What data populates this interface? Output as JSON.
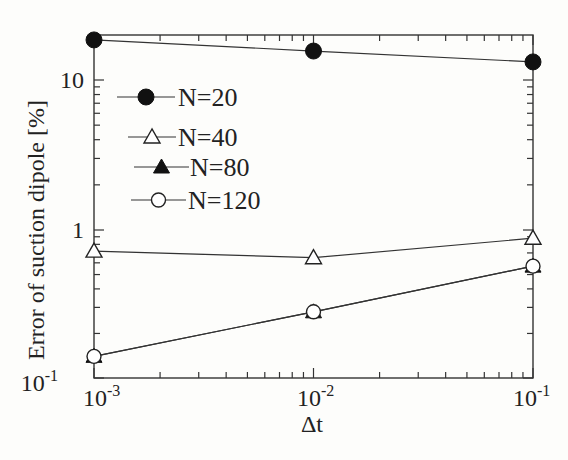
{
  "chart_data": {
    "type": "line",
    "title": "",
    "xlabel": "Δt",
    "ylabel": "Error of suction dipole [%]",
    "xscale": "log",
    "yscale": "log",
    "xlim": [
      0.001,
      0.1
    ],
    "ylim": [
      0.1,
      20
    ],
    "x_tick_labels": [
      "10^-3",
      "10^-2",
      "10^-1"
    ],
    "y_tick_labels": [
      "10^-1",
      "1",
      "10"
    ],
    "grid": false,
    "legend_position": "upper left",
    "x": [
      0.001,
      0.01,
      0.1
    ],
    "series": [
      {
        "name": "N=20",
        "marker": "filled-circle",
        "values": [
          18.5,
          15.6,
          13.2
        ]
      },
      {
        "name": "N=40",
        "marker": "open-triangle",
        "values": [
          0.72,
          0.65,
          0.88
        ]
      },
      {
        "name": "N=80",
        "marker": "filled-triangle",
        "values": [
          0.14,
          0.28,
          0.57
        ]
      },
      {
        "name": "N=120",
        "marker": "open-circle",
        "values": [
          0.14,
          0.28,
          0.57
        ]
      }
    ]
  },
  "labels": {
    "xlabel": "Δt",
    "ylabel": "Error of suction dipole [%]",
    "y10": "10",
    "y1": "1",
    "ymin_base": "10",
    "ymin_exp": "-1",
    "x1_base": "10",
    "x1_exp": "-3",
    "x2_base": "10",
    "x2_exp": "-2",
    "x3_base": "10",
    "x3_exp": "-1",
    "legend": [
      "N=20",
      "N=40",
      "N=80",
      "N=120"
    ]
  }
}
